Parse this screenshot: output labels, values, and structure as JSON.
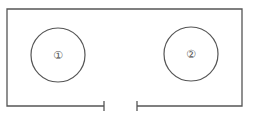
{
  "diagram": {
    "type": "floor-plan",
    "colors": {
      "line": "#555555",
      "background": "#ffffff"
    },
    "room": {
      "left": 7,
      "top": 9,
      "right": 242,
      "bottom": 106,
      "door_gap": [
        104,
        137
      ]
    },
    "circles": [
      {
        "id": "circle-1",
        "label": "①",
        "cx": 58,
        "cy": 55,
        "r": 27
      },
      {
        "id": "circle-2",
        "label": "②",
        "cx": 191,
        "cy": 54,
        "r": 27
      }
    ]
  }
}
